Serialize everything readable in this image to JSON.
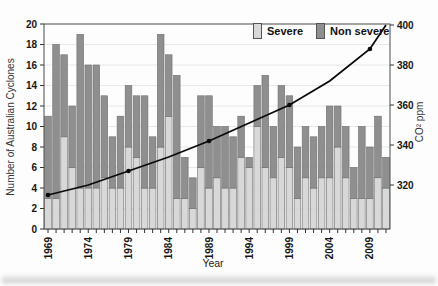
{
  "figure": {
    "background": "#fdfdfd"
  },
  "legend": {
    "items": [
      {
        "label": "Severe",
        "color": "#d8d8d8"
      },
      {
        "label": "Non severe",
        "color": "#8f8f8f"
      }
    ]
  },
  "chart_data": {
    "type": "bar",
    "stacked": true,
    "title": "",
    "xlabel": "Year",
    "ylabel_left": "Number of Australian Cyclones",
    "ylabel_right": "CO² ppm",
    "grid": "horizontal light gridlines every 2 units",
    "legend_position": "top-center inside plot",
    "years": [
      1969,
      1970,
      1971,
      1972,
      1973,
      1974,
      1975,
      1976,
      1977,
      1978,
      1979,
      1980,
      1981,
      1982,
      1983,
      1984,
      1985,
      1986,
      1987,
      1988,
      1989,
      1990,
      1991,
      1992,
      1993,
      1994,
      1995,
      1996,
      1997,
      1998,
      1999,
      2000,
      2001,
      2002,
      2003,
      2004,
      2005,
      2006,
      2007,
      2008,
      2009,
      2010,
      2011
    ],
    "x_tick_label_years": [
      1969,
      1974,
      1979,
      1984,
      1989,
      1994,
      1999,
      2004,
      2009
    ],
    "ylim_left": [
      0,
      20
    ],
    "yticks_left": [
      0,
      2,
      4,
      6,
      8,
      10,
      12,
      14,
      16,
      18,
      20
    ],
    "ylim_right_approx": [
      298,
      400
    ],
    "yticks_right": [
      320,
      340,
      360,
      380,
      400
    ],
    "series": [
      {
        "name": "Severe",
        "color": "#d8d8d8",
        "values": [
          3,
          3,
          9,
          6,
          4,
          4,
          4,
          5,
          4,
          4,
          8,
          7,
          4,
          4,
          8,
          11,
          3,
          3,
          2,
          6,
          4,
          5,
          4,
          4,
          7,
          6,
          10,
          6,
          5,
          7,
          6,
          3,
          5,
          4,
          5,
          5,
          8,
          5,
          3,
          3,
          3,
          5,
          4
        ]
      },
      {
        "name": "Non severe",
        "color": "#8f8f8f",
        "values": [
          8,
          15,
          8,
          6,
          15,
          12,
          12,
          8,
          5,
          7,
          6,
          6,
          9,
          5,
          11,
          6,
          12,
          4,
          3,
          7,
          9,
          5,
          6,
          5,
          4,
          1,
          4,
          9,
          5,
          7,
          7,
          5,
          5,
          5,
          5,
          7,
          4,
          5,
          3,
          7,
          5,
          6,
          3
        ]
      }
    ],
    "totals": [
      11,
      18,
      17,
      12,
      19,
      16,
      16,
      13,
      9,
      11,
      14,
      13,
      13,
      9,
      19,
      17,
      15,
      7,
      5,
      13,
      13,
      10,
      10,
      9,
      11,
      7,
      14,
      15,
      10,
      14,
      13,
      8,
      10,
      9,
      10,
      12,
      12,
      10,
      6,
      10,
      8,
      11,
      7
    ],
    "line_series": {
      "name": "CO2 concentration (ppm)",
      "color": "#0a0a0a",
      "points_year_ppm": [
        [
          1969,
          315
        ],
        [
          1974,
          320
        ],
        [
          1979,
          327
        ],
        [
          1984,
          334
        ],
        [
          1989,
          342
        ],
        [
          1994,
          351
        ],
        [
          1999,
          360
        ],
        [
          2004,
          372
        ],
        [
          2009,
          388
        ],
        [
          2011,
          400
        ]
      ],
      "marker_years": [
        1969,
        1979,
        1989,
        1999,
        2009
      ]
    }
  }
}
